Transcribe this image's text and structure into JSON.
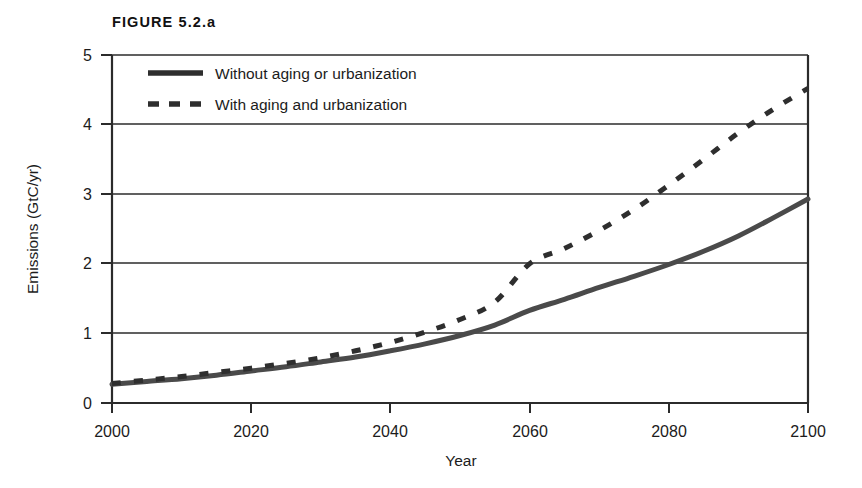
{
  "figure": {
    "title": "FIGURE 5.2.a"
  },
  "chart_data": {
    "type": "line",
    "title": "FIGURE 5.2.a",
    "xlabel": "Year",
    "ylabel": "Emissions (GtC/yr)",
    "xlim": [
      2000,
      2100
    ],
    "ylim": [
      0,
      5
    ],
    "xticks": [
      "2000",
      "2020",
      "2040",
      "2060",
      "2080",
      "2100"
    ],
    "yticks": [
      "0",
      "1",
      "2",
      "3",
      "4",
      "5"
    ],
    "grid": "horizontal",
    "legend_position": "top-left-inside",
    "x": [
      2000,
      2005,
      2010,
      2015,
      2020,
      2025,
      2030,
      2035,
      2040,
      2045,
      2050,
      2055,
      2060,
      2065,
      2070,
      2075,
      2080,
      2085,
      2090,
      2095,
      2100
    ],
    "series": [
      {
        "name": "Without aging or urbanization",
        "style": "solid",
        "color": "#4a4a4a",
        "values": [
          0.27,
          0.31,
          0.35,
          0.4,
          0.46,
          0.52,
          0.59,
          0.66,
          0.75,
          0.85,
          0.97,
          1.12,
          1.33,
          1.49,
          1.66,
          1.82,
          1.99,
          2.18,
          2.4,
          2.66,
          2.93
        ]
      },
      {
        "name": "With aging and urbanization",
        "style": "dashed",
        "color": "#2e2e2e",
        "values": [
          0.28,
          0.33,
          0.38,
          0.44,
          0.5,
          0.57,
          0.65,
          0.75,
          0.87,
          1.02,
          1.2,
          1.45,
          2.0,
          2.22,
          2.48,
          2.78,
          3.13,
          3.5,
          3.88,
          4.22,
          4.52
        ]
      }
    ],
    "annotations": []
  },
  "legend": {
    "items": [
      {
        "label": "Without aging or urbanization",
        "style": "solid"
      },
      {
        "label": "With aging and urbanization",
        "style": "dashed"
      }
    ]
  }
}
